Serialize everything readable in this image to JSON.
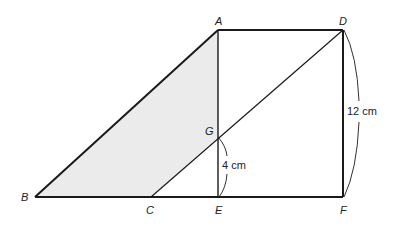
{
  "diagram": {
    "colors": {
      "stroke": "#1a1a1a",
      "shade": "#ebebeb",
      "background": "#ffffff"
    },
    "points": {
      "A": {
        "label": "A",
        "x": 218,
        "y": 30
      },
      "D": {
        "label": "D",
        "x": 343,
        "y": 30
      },
      "B": {
        "label": "B",
        "x": 35,
        "y": 197
      },
      "C": {
        "label": "C",
        "x": 151,
        "y": 197
      },
      "E": {
        "label": "E",
        "x": 218,
        "y": 197
      },
      "F": {
        "label": "F",
        "x": 343,
        "y": 197
      },
      "G": {
        "label": "G",
        "x": 218,
        "y": 137
      }
    },
    "shaded_region": [
      "A",
      "B",
      "C",
      "G"
    ],
    "segments": [
      [
        "A",
        "D"
      ],
      [
        "A",
        "B"
      ],
      [
        "B",
        "F"
      ],
      [
        "D",
        "F"
      ],
      [
        "A",
        "E"
      ],
      [
        "C",
        "D"
      ]
    ],
    "measurements": {
      "GE": "4 cm",
      "DF": "12 cm"
    }
  }
}
